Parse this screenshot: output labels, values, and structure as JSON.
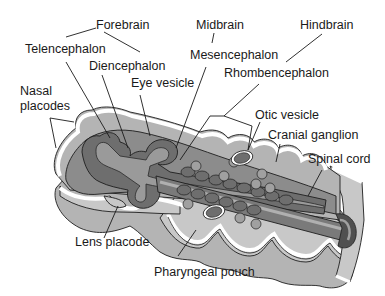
{
  "diagram": {
    "colors": {
      "background": "#ffffff",
      "text": "#1a1a1a",
      "outer_tissue": "#b4b4b4",
      "outer_tissue_light": "#c8c8c8",
      "mid_tissue": "#8c8c8c",
      "neural_tube": "#6e6e6e",
      "neural_lumen": "#9a9a9a",
      "dark_wall": "#505050",
      "ectoderm_border": "#ffffff"
    },
    "labels": {
      "forebrain": "Forebrain",
      "telencephalon": "Telencephalon",
      "diencephalon": "Diencephalon",
      "eye_vesicle": "Eye vesicle",
      "nasal_placodes_line1": "Nasal",
      "nasal_placodes_line2": "placodes",
      "midbrain": "Midbrain",
      "mesencephalon": "Mesencephalon",
      "hindbrain": "Hindbrain",
      "rhombencephalon": "Rhombencephalon",
      "otic_vesicle": "Otic vesicle",
      "cranial_ganglion": "Cranial ganglion",
      "spinal_cord": "Spinal cord",
      "lens_placode": "Lens placode",
      "pharyngeal_pouch": "Pharyngeal pouch"
    }
  }
}
